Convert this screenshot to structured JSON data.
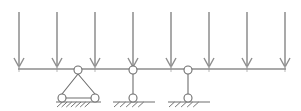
{
  "diagram": {
    "type": "structural-beam-load-diagram",
    "canvas": {
      "width": 301,
      "height": 111
    },
    "colors": {
      "background": "#ffffff",
      "load_arrow": "#8d8d8d",
      "beam": "#8d8d8d",
      "beam_tick": "#b9b9b9",
      "support": "#6e6e6e",
      "pin_fill": "#ffffff"
    },
    "beam": {
      "label": "beam",
      "x_start": 18,
      "x_end": 286,
      "y": 69
    },
    "loads": {
      "label": "distributed downward load arrows",
      "count": 8,
      "y_top": 12,
      "y_tip": 67,
      "head_half_width": 5,
      "head_height": 9,
      "x_positions": [
        19,
        57,
        95,
        133,
        171,
        209,
        247,
        285
      ]
    },
    "beam_ticks": {
      "label": "beam division ticks",
      "x_positions": [
        19,
        57,
        95,
        133,
        171,
        209,
        247,
        285
      ],
      "y_top": 66,
      "y_bottom": 72
    },
    "supports": [
      {
        "name": "a-frame-support",
        "kind": "triangular two-pin frame",
        "top_pin": {
          "cx": 78,
          "cy": 70,
          "r": 4
        },
        "base_pins": [
          {
            "cx": 62,
            "cy": 98,
            "r": 4
          },
          {
            "cx": 95,
            "cy": 98,
            "r": 4
          }
        ],
        "ground": {
          "x_start": 56,
          "x_end": 101,
          "y": 102
        },
        "hatch_count": 7
      },
      {
        "name": "vertical-link-support-1",
        "kind": "vertical hanger link",
        "top_pin": {
          "cx": 133,
          "cy": 70,
          "r": 4
        },
        "base_pins": [
          {
            "cx": 133,
            "cy": 98,
            "r": 4
          }
        ],
        "ground": {
          "x_start": 113,
          "x_end": 155,
          "y": 102
        },
        "hatch_count": 5
      },
      {
        "name": "vertical-link-support-2",
        "kind": "vertical hanger link",
        "top_pin": {
          "cx": 188,
          "cy": 70,
          "r": 4
        },
        "base_pins": [
          {
            "cx": 188,
            "cy": 98,
            "r": 4
          }
        ],
        "ground": {
          "x_start": 168,
          "x_end": 210,
          "y": 102
        },
        "hatch_count": 5
      }
    ]
  }
}
